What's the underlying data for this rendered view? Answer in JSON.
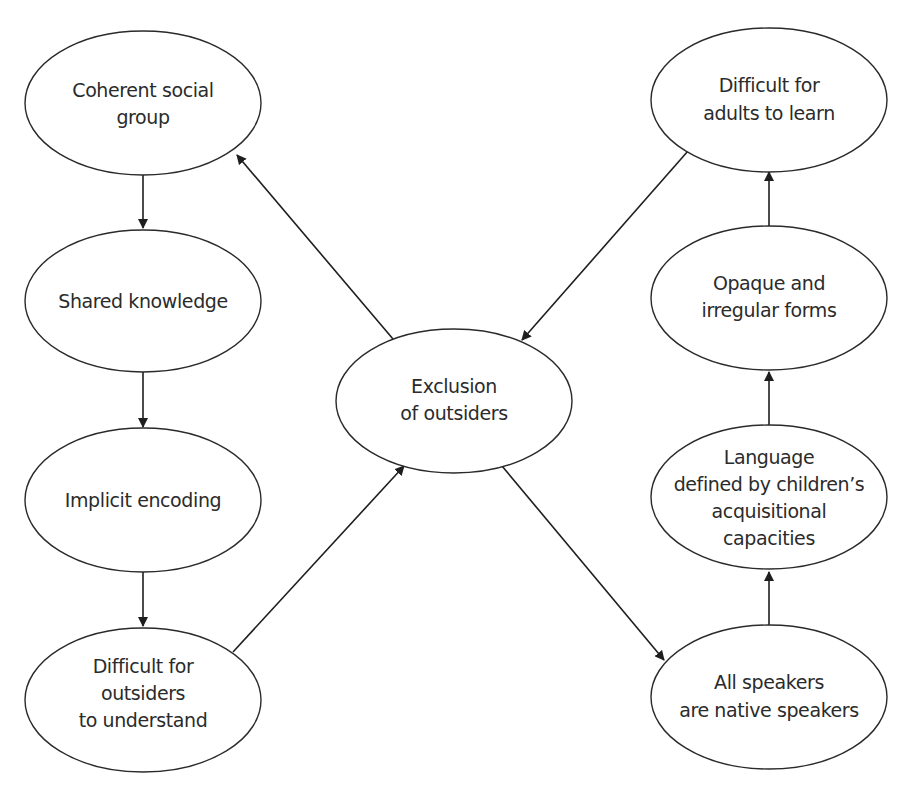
{
  "diagram": {
    "type": "flow-cycle",
    "nodes": [
      {
        "id": "coherent",
        "lines": [
          "Coherent social",
          "group"
        ],
        "cx": 143,
        "cy": 103
      },
      {
        "id": "shared",
        "lines": [
          "Shared knowledge"
        ],
        "cx": 143,
        "cy": 301
      },
      {
        "id": "implicit",
        "lines": [
          "Implicit encoding"
        ],
        "cx": 143,
        "cy": 500
      },
      {
        "id": "outsiders",
        "lines": [
          "Difficult for",
          "outsiders",
          "to understand"
        ],
        "cx": 143,
        "cy": 700
      },
      {
        "id": "exclusion",
        "lines": [
          "Exclusion",
          "of outsiders"
        ],
        "cx": 454,
        "cy": 401
      },
      {
        "id": "adults",
        "lines": [
          "Difficult for",
          "adults to learn"
        ],
        "cx": 769,
        "cy": 100
      },
      {
        "id": "opaque",
        "lines": [
          "Opaque and",
          "irregular forms"
        ],
        "cx": 769,
        "cy": 298
      },
      {
        "id": "language",
        "lines": [
          "Language",
          "defined by children’s",
          "acquisitional",
          "capacities"
        ],
        "cx": 769,
        "cy": 497
      },
      {
        "id": "native",
        "lines": [
          "All speakers",
          "are native speakers"
        ],
        "cx": 769,
        "cy": 697
      }
    ],
    "edges": [
      {
        "from": "coherent",
        "to": "shared"
      },
      {
        "from": "shared",
        "to": "implicit"
      },
      {
        "from": "implicit",
        "to": "outsiders"
      },
      {
        "from": "outsiders",
        "to": "exclusion"
      },
      {
        "from": "exclusion",
        "to": "coherent"
      },
      {
        "from": "exclusion",
        "to": "native"
      },
      {
        "from": "native",
        "to": "language"
      },
      {
        "from": "language",
        "to": "opaque"
      },
      {
        "from": "opaque",
        "to": "adults"
      },
      {
        "from": "adults",
        "to": "exclusion"
      }
    ]
  }
}
